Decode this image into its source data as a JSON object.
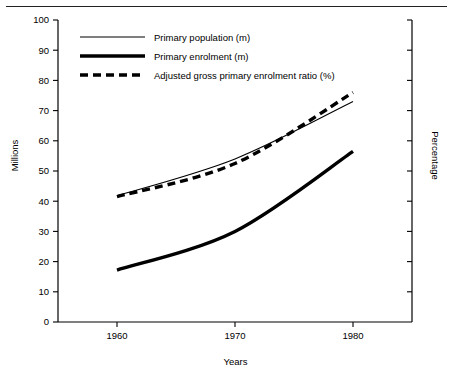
{
  "chart_data": {
    "type": "line",
    "title": "",
    "xlabel": "Years",
    "ylabel": "Millions",
    "ylabel_right": "Percentage",
    "xlim": [
      1955,
      1985
    ],
    "ylim": [
      0,
      100
    ],
    "grid": false,
    "legend_position": "top-left-inside",
    "x": [
      1960,
      1970,
      1980
    ],
    "xticks": [
      "1960",
      "1970",
      "1980"
    ],
    "yticks": [
      "0",
      "10",
      "20",
      "30",
      "40",
      "50",
      "60",
      "70",
      "80",
      "90",
      "100"
    ],
    "ytick_values": [
      0,
      10,
      20,
      30,
      40,
      50,
      60,
      70,
      80,
      90,
      100
    ],
    "right_axis_ticks_labeled": false,
    "series": [
      {
        "name": "Primary population (m)",
        "style": "thin-solid",
        "values": [
          41.8,
          54.0,
          73.0
        ]
      },
      {
        "name": "Primary enrolment (m)",
        "style": "thick-solid",
        "values": [
          17.2,
          30.0,
          56.5
        ]
      },
      {
        "name": "Adjusted gross primary enrolment ratio (%)",
        "style": "thick-dashed",
        "values": [
          41.5,
          52.5,
          76.0
        ]
      }
    ]
  },
  "legend": {
    "items": [
      {
        "label": "Primary population (m)",
        "style": "thin-solid"
      },
      {
        "label": "Primary enrolment (m)",
        "style": "thick-solid"
      },
      {
        "label": "Adjusted gross primary enrolment ratio (%)",
        "style": "thick-dashed"
      }
    ]
  },
  "axes": {
    "left_title": "Millions",
    "right_title": "Percentage",
    "bottom_title": "Years"
  },
  "colors": {
    "ink": "#000000",
    "background": "#ffffff",
    "rule": "#222222"
  }
}
